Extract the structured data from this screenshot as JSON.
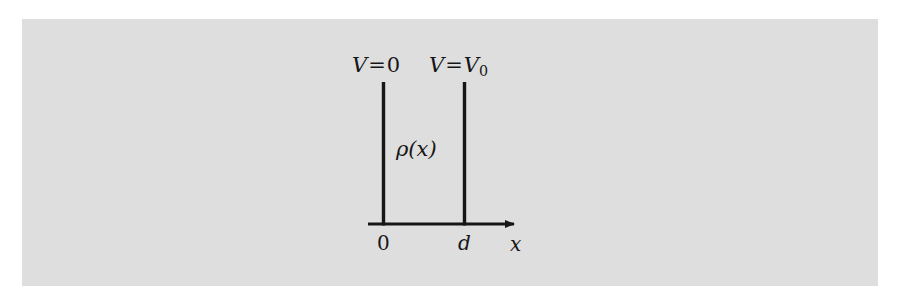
{
  "figure": {
    "kind": "physics-diagram",
    "panel_background_color": "#dedede",
    "page_background_color": "#ffffff",
    "stroke_color": "#161616"
  },
  "labels": {
    "left_plate_potential": {
      "symbol": "V",
      "relation": "=",
      "value": "0"
    },
    "right_plate_potential": {
      "symbol": "V",
      "relation": "=",
      "value": "V",
      "subscript": "0"
    },
    "charge_density": {
      "symbol": "ρ",
      "argument": "(x)"
    },
    "origin_tick": "0",
    "separation_tick": "d",
    "axis_label": "x"
  },
  "geometry": {
    "left_plate_x": 383,
    "right_plate_x": 464,
    "plate_top_y": 82,
    "axis_y": 224,
    "axis_start_x": 368,
    "axis_end_x": 524,
    "line_width": 3
  }
}
